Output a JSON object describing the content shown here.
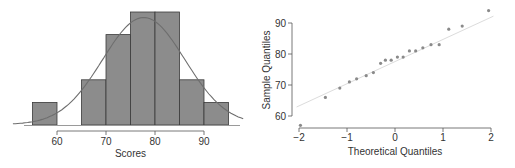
{
  "chart_data": [
    {
      "type": "bar",
      "subtype": "histogram",
      "title": "",
      "xlabel": "Scores",
      "ylabel": "",
      "bins": [
        [
          55,
          60
        ],
        [
          60,
          65
        ],
        [
          65,
          70
        ],
        [
          70,
          75
        ],
        [
          75,
          80
        ],
        [
          80,
          85
        ],
        [
          85,
          90
        ],
        [
          90,
          95
        ]
      ],
      "categories": [
        "55-60",
        "60-65",
        "65-70",
        "70-75",
        "75-80",
        "80-85",
        "85-90",
        "90-95"
      ],
      "values": [
        1,
        0,
        2,
        4,
        5,
        5,
        2,
        1
      ],
      "xticks": [
        60,
        70,
        80,
        90
      ],
      "xlim": [
        53,
        97
      ],
      "overlay": {
        "type": "normal-density-curve",
        "mean": 77.7,
        "sd": 8.4
      },
      "colors": {
        "bar": "#8c8c8c",
        "bar_edge": "#3a3a3a",
        "curve": "#6e6e6e"
      }
    },
    {
      "type": "scatter",
      "subtype": "normal-qq-plot",
      "title": "",
      "xlabel": "Theoretical Quantiles",
      "ylabel": "Sample Quantiles",
      "xticks": [
        -2,
        -1,
        0,
        1,
        2
      ],
      "yticks": [
        60,
        70,
        80,
        90
      ],
      "xlim": [
        -2.1,
        2.1
      ],
      "ylim": [
        56,
        95
      ],
      "x": [
        -1.97,
        -1.45,
        -1.15,
        -0.95,
        -0.8,
        -0.6,
        -0.45,
        -0.3,
        -0.2,
        -0.08,
        0.05,
        0.17,
        0.3,
        0.43,
        0.58,
        0.75,
        0.92,
        1.12,
        1.4,
        1.95
      ],
      "y": [
        57,
        66,
        69,
        71,
        72,
        73,
        74,
        77,
        78,
        78,
        79,
        79,
        81,
        81,
        82,
        83,
        83,
        88,
        89,
        94
      ],
      "reference_line": {
        "x0": -2.05,
        "y0": 62.9,
        "x1": 2.05,
        "y1": 92.2
      },
      "colors": {
        "point": "#8a8a8a",
        "line": "#dcdcdc"
      }
    }
  ]
}
